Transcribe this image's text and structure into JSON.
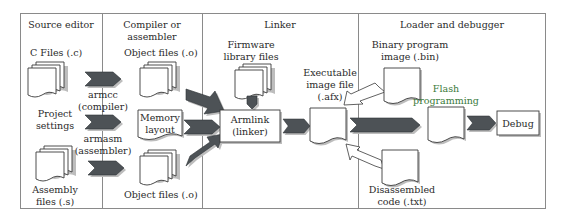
{
  "sections": [
    {
      "id": "source-editor",
      "title": "Source editor"
    },
    {
      "id": "compiler",
      "title_lines": [
        "Compiler or",
        "assembler"
      ]
    },
    {
      "id": "linker",
      "title": "Linker"
    },
    {
      "id": "loader",
      "title": "Loader and debugger"
    }
  ],
  "source_editor": {
    "c_files": "C Files (.c)",
    "project_settings": [
      "Project",
      "settings"
    ],
    "assembly_files": [
      "Assembly",
      "files (.s)"
    ]
  },
  "tools": {
    "armcc": [
      "armcc",
      "(compiler)"
    ],
    "armasm": [
      "armasm",
      "(assembler)"
    ]
  },
  "compiler": {
    "object_files_top": "Object files (.o)",
    "memory_layout": [
      "Memory",
      "layout"
    ],
    "object_files_bottom": "Object files (.o)"
  },
  "linker": {
    "firmware": [
      "Firmware",
      "library files"
    ],
    "armlink": [
      "Armlink",
      "(linker)"
    ],
    "executable": [
      "Executable",
      "image file",
      "(.afx)"
    ]
  },
  "loader": {
    "binary": [
      "Binary program",
      "image (.bin)"
    ],
    "flash": [
      "Flash",
      "programming"
    ],
    "debug": "Debug",
    "disassembled": [
      "Disassembled",
      "code (.txt)"
    ]
  },
  "colors": {
    "arrow_dark": "#4d5256",
    "frame": "#8a8a8a",
    "flash_label": "#3a7a3a"
  }
}
